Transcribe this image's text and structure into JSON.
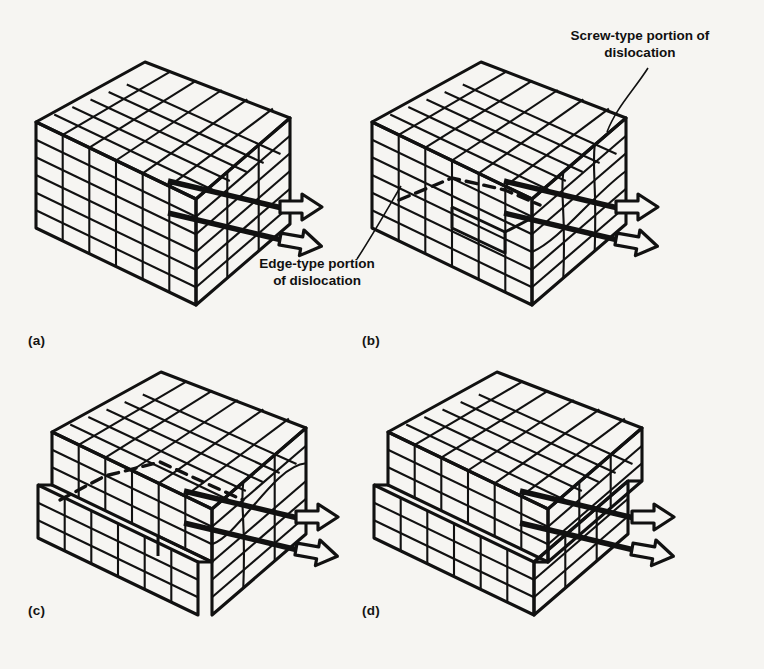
{
  "figure": {
    "background_color": "#f6f5f2",
    "ink_color": "#111111",
    "panels": [
      {
        "id": "a",
        "label": "(a)",
        "caption": "Perfect crystal block before slip",
        "state": "undeformed",
        "slip_fraction": 0.0
      },
      {
        "id": "b",
        "label": "(b)",
        "caption": "Dislocation nucleated at right face; mixed edge and screw character",
        "state": "partially-slipped",
        "slip_fraction": 0.35
      },
      {
        "id": "c",
        "label": "(c)",
        "caption": "Dislocation sweeps further across the slip plane",
        "state": "partially-slipped",
        "slip_fraction": 0.7
      },
      {
        "id": "d",
        "label": "(d)",
        "caption": "Dislocation has exited; unit step of slip produced",
        "state": "fully-slipped",
        "slip_fraction": 1.0
      }
    ],
    "annotations": [
      {
        "id": "screw",
        "text": "Screw-type portion of\ndislocation",
        "lines": [
          "Screw-type portion of",
          "dislocation"
        ],
        "target_panel": "b"
      },
      {
        "id": "edge",
        "text": "Edge-type portion\nof dislocation",
        "lines": [
          "Edge-type portion",
          "of dislocation"
        ],
        "target_panel": "b"
      }
    ],
    "lattice": {
      "front_columns": 6,
      "front_rows": 6,
      "top_depth_rows": 6,
      "side_columns": 3
    },
    "arrows": {
      "count_per_panel": 2,
      "style": "hollow-outline-block-arrow",
      "direction": "right",
      "meaning": "applied shear stress"
    }
  }
}
